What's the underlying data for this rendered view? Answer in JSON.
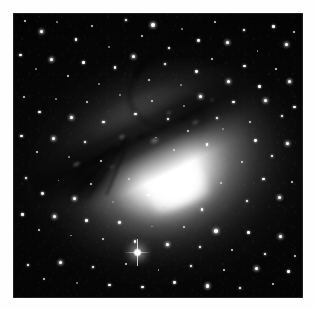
{
  "image": {
    "kind": "astronomical-photograph",
    "subject": "elliptical galaxy with dark dust lane",
    "orientation": "square plate, white mat border",
    "alt_text": "",
    "caption": "",
    "background_color": "#030303",
    "mat_color": "#fefefe",
    "glow_color": "#ffffff",
    "dust_color": "#050505"
  },
  "frame": {
    "x": 13,
    "y": 13,
    "width": 290,
    "height": 285
  },
  "galaxy": {
    "core_center_pct": [
      56,
      58
    ],
    "halo_rotation_deg": -21,
    "dust_lane_rotation_deg": -26,
    "dust_lane_direction": "lower-left to upper-right"
  },
  "stars": [
    {
      "x": 4.1,
      "y": 2.8,
      "r": 1.1,
      "cls": "dim"
    },
    {
      "x": 9.8,
      "y": 6.4,
      "r": 1.6,
      "cls": "big"
    },
    {
      "x": 15.2,
      "y": 3.1,
      "r": 0.9,
      "cls": "faint"
    },
    {
      "x": 21.7,
      "y": 9.2,
      "r": 1.3,
      "cls": ""
    },
    {
      "x": 27.4,
      "y": 4.6,
      "r": 1.0,
      "cls": "dim"
    },
    {
      "x": 33.1,
      "y": 11.8,
      "r": 0.9,
      "cls": "faint"
    },
    {
      "x": 38.9,
      "y": 2.4,
      "r": 1.2,
      "cls": ""
    },
    {
      "x": 44.6,
      "y": 7.9,
      "r": 1.0,
      "cls": "dim"
    },
    {
      "x": 48.2,
      "y": 4.1,
      "r": 1.9,
      "cls": "big"
    },
    {
      "x": 53.8,
      "y": 12.3,
      "r": 1.1,
      "cls": ""
    },
    {
      "x": 58.4,
      "y": 5.6,
      "r": 0.9,
      "cls": "faint"
    },
    {
      "x": 63.9,
      "y": 9.7,
      "r": 1.4,
      "cls": ""
    },
    {
      "x": 69.5,
      "y": 3.3,
      "r": 1.0,
      "cls": "dim"
    },
    {
      "x": 74.1,
      "y": 10.4,
      "r": 1.6,
      "cls": "big"
    },
    {
      "x": 79.6,
      "y": 6.1,
      "r": 1.1,
      "cls": ""
    },
    {
      "x": 84.3,
      "y": 13.2,
      "r": 0.9,
      "cls": "faint"
    },
    {
      "x": 89.8,
      "y": 4.8,
      "r": 1.3,
      "cls": ""
    },
    {
      "x": 94.2,
      "y": 10.9,
      "r": 1.5,
      "cls": "big"
    },
    {
      "x": 96.8,
      "y": 6.7,
      "r": 1.0,
      "cls": "dim"
    },
    {
      "x": 2.6,
      "y": 14.8,
      "r": 1.2,
      "cls": ""
    },
    {
      "x": 7.9,
      "y": 19.6,
      "r": 0.9,
      "cls": "faint"
    },
    {
      "x": 13.4,
      "y": 16.2,
      "r": 1.5,
      "cls": "big"
    },
    {
      "x": 18.8,
      "y": 22.1,
      "r": 1.0,
      "cls": "dim"
    },
    {
      "x": 24.3,
      "y": 17.4,
      "r": 1.2,
      "cls": ""
    },
    {
      "x": 29.7,
      "y": 24.8,
      "r": 0.9,
      "cls": "faint"
    },
    {
      "x": 35.2,
      "y": 19.1,
      "r": 1.1,
      "cls": ""
    },
    {
      "x": 41.6,
      "y": 15.3,
      "r": 1.7,
      "cls": "big"
    },
    {
      "x": 46.9,
      "y": 23.6,
      "r": 1.0,
      "cls": "dim"
    },
    {
      "x": 52.4,
      "y": 17.8,
      "r": 1.2,
      "cls": ""
    },
    {
      "x": 57.8,
      "y": 25.2,
      "r": 0.9,
      "cls": "faint"
    },
    {
      "x": 63.3,
      "y": 20.4,
      "r": 1.4,
      "cls": ""
    },
    {
      "x": 68.7,
      "y": 16.1,
      "r": 1.0,
      "cls": "dim"
    },
    {
      "x": 74.2,
      "y": 23.9,
      "r": 1.6,
      "cls": "big"
    },
    {
      "x": 79.8,
      "y": 18.6,
      "r": 1.1,
      "cls": ""
    },
    {
      "x": 85.1,
      "y": 25.7,
      "r": 1.3,
      "cls": ""
    },
    {
      "x": 90.6,
      "y": 19.8,
      "r": 1.0,
      "cls": "dim"
    },
    {
      "x": 95.4,
      "y": 24.2,
      "r": 1.5,
      "cls": "big"
    },
    {
      "x": 3.8,
      "y": 29.4,
      "r": 1.0,
      "cls": "dim"
    },
    {
      "x": 9.2,
      "y": 34.8,
      "r": 1.3,
      "cls": ""
    },
    {
      "x": 14.7,
      "y": 30.1,
      "r": 0.9,
      "cls": "faint"
    },
    {
      "x": 20.1,
      "y": 36.6,
      "r": 1.6,
      "cls": "big"
    },
    {
      "x": 25.6,
      "y": 31.3,
      "r": 1.0,
      "cls": "dim"
    },
    {
      "x": 31.2,
      "y": 38.2,
      "r": 1.1,
      "cls": ""
    },
    {
      "x": 36.8,
      "y": 28.7,
      "r": 0.9,
      "cls": "faint"
    },
    {
      "x": 42.3,
      "y": 35.4,
      "r": 1.2,
      "cls": ""
    },
    {
      "x": 47.9,
      "y": 30.8,
      "r": 1.0,
      "cls": "dim"
    },
    {
      "x": 53.4,
      "y": 37.1,
      "r": 1.1,
      "cls": ""
    },
    {
      "x": 59.1,
      "y": 32.6,
      "r": 0.9,
      "cls": "faint"
    },
    {
      "x": 64.8,
      "y": 29.3,
      "r": 1.5,
      "cls": "big"
    },
    {
      "x": 70.4,
      "y": 36.9,
      "r": 1.1,
      "cls": ""
    },
    {
      "x": 76.1,
      "y": 31.2,
      "r": 1.3,
      "cls": ""
    },
    {
      "x": 81.6,
      "y": 38.4,
      "r": 1.0,
      "cls": "dim"
    },
    {
      "x": 87.2,
      "y": 30.6,
      "r": 1.6,
      "cls": "big"
    },
    {
      "x": 92.8,
      "y": 36.1,
      "r": 1.1,
      "cls": ""
    },
    {
      "x": 97.1,
      "y": 32.9,
      "r": 1.2,
      "cls": ""
    },
    {
      "x": 2.9,
      "y": 43.2,
      "r": 1.2,
      "cls": ""
    },
    {
      "x": 8.4,
      "y": 48.7,
      "r": 1.0,
      "cls": "dim"
    },
    {
      "x": 13.9,
      "y": 44.1,
      "r": 1.5,
      "cls": "big"
    },
    {
      "x": 19.3,
      "y": 50.6,
      "r": 0.9,
      "cls": "faint"
    },
    {
      "x": 24.8,
      "y": 45.3,
      "r": 1.1,
      "cls": ""
    },
    {
      "x": 30.4,
      "y": 52.1,
      "r": 1.0,
      "cls": "dim"
    },
    {
      "x": 83.7,
      "y": 44.8,
      "r": 1.4,
      "cls": ""
    },
    {
      "x": 89.2,
      "y": 50.3,
      "r": 1.1,
      "cls": ""
    },
    {
      "x": 94.6,
      "y": 45.7,
      "r": 1.6,
      "cls": "big"
    },
    {
      "x": 79.1,
      "y": 52.4,
      "r": 1.0,
      "cls": "dim"
    },
    {
      "x": 4.6,
      "y": 57.9,
      "r": 1.1,
      "cls": ""
    },
    {
      "x": 10.2,
      "y": 63.4,
      "r": 1.4,
      "cls": ""
    },
    {
      "x": 15.7,
      "y": 58.8,
      "r": 0.9,
      "cls": "faint"
    },
    {
      "x": 21.3,
      "y": 65.2,
      "r": 1.6,
      "cls": "big"
    },
    {
      "x": 26.8,
      "y": 60.1,
      "r": 1.0,
      "cls": "dim"
    },
    {
      "x": 86.4,
      "y": 58.3,
      "r": 1.2,
      "cls": ""
    },
    {
      "x": 91.8,
      "y": 64.7,
      "r": 1.5,
      "cls": "big"
    },
    {
      "x": 96.3,
      "y": 59.2,
      "r": 1.0,
      "cls": "dim"
    },
    {
      "x": 80.6,
      "y": 66.1,
      "r": 1.1,
      "cls": ""
    },
    {
      "x": 3.2,
      "y": 70.6,
      "r": 1.3,
      "cls": ""
    },
    {
      "x": 8.8,
      "y": 76.2,
      "r": 1.0,
      "cls": "dim"
    },
    {
      "x": 14.3,
      "y": 71.4,
      "r": 1.7,
      "cls": "big"
    },
    {
      "x": 19.9,
      "y": 78.1,
      "r": 0.9,
      "cls": "faint"
    },
    {
      "x": 25.4,
      "y": 72.8,
      "r": 1.2,
      "cls": ""
    },
    {
      "x": 31.1,
      "y": 79.3,
      "r": 1.0,
      "cls": "dim"
    },
    {
      "x": 36.7,
      "y": 73.6,
      "r": 1.4,
      "cls": ""
    },
    {
      "x": 42.2,
      "y": 80.2,
      "r": 1.1,
      "cls": ""
    },
    {
      "x": 47.8,
      "y": 74.9,
      "r": 0.9,
      "cls": "faint"
    },
    {
      "x": 53.3,
      "y": 81.4,
      "r": 1.5,
      "cls": "big"
    },
    {
      "x": 58.9,
      "y": 75.2,
      "r": 1.0,
      "cls": "dim"
    },
    {
      "x": 64.4,
      "y": 82.1,
      "r": 1.2,
      "cls": ""
    },
    {
      "x": 70.1,
      "y": 76.4,
      "r": 1.8,
      "cls": "big"
    },
    {
      "x": 75.6,
      "y": 83.2,
      "r": 1.0,
      "cls": "dim"
    },
    {
      "x": 81.2,
      "y": 77.1,
      "r": 1.3,
      "cls": ""
    },
    {
      "x": 86.8,
      "y": 84.6,
      "r": 1.1,
      "cls": ""
    },
    {
      "x": 92.3,
      "y": 78.3,
      "r": 1.6,
      "cls": "big"
    },
    {
      "x": 97.2,
      "y": 85.1,
      "r": 1.0,
      "cls": "dim"
    },
    {
      "x": 5.1,
      "y": 88.4,
      "r": 1.2,
      "cls": ""
    },
    {
      "x": 10.8,
      "y": 93.2,
      "r": 1.0,
      "cls": "dim"
    },
    {
      "x": 16.4,
      "y": 87.6,
      "r": 1.5,
      "cls": "big"
    },
    {
      "x": 22.1,
      "y": 94.8,
      "r": 0.9,
      "cls": "faint"
    },
    {
      "x": 27.7,
      "y": 89.1,
      "r": 1.1,
      "cls": ""
    },
    {
      "x": 33.3,
      "y": 95.4,
      "r": 1.3,
      "cls": ""
    },
    {
      "x": 38.9,
      "y": 88.2,
      "r": 1.0,
      "cls": "dim"
    },
    {
      "x": 44.6,
      "y": 96.1,
      "r": 1.2,
      "cls": ""
    },
    {
      "x": 50.2,
      "y": 90.3,
      "r": 0.9,
      "cls": "faint"
    },
    {
      "x": 55.8,
      "y": 94.6,
      "r": 1.4,
      "cls": ""
    },
    {
      "x": 61.4,
      "y": 88.9,
      "r": 1.1,
      "cls": ""
    },
    {
      "x": 67.1,
      "y": 95.8,
      "r": 1.6,
      "cls": "big"
    },
    {
      "x": 72.7,
      "y": 90.1,
      "r": 1.0,
      "cls": "dim"
    },
    {
      "x": 78.3,
      "y": 96.4,
      "r": 1.2,
      "cls": ""
    },
    {
      "x": 83.9,
      "y": 89.6,
      "r": 1.5,
      "cls": "big"
    },
    {
      "x": 89.6,
      "y": 95.2,
      "r": 1.0,
      "cls": "dim"
    },
    {
      "x": 95.1,
      "y": 90.8,
      "r": 1.3,
      "cls": ""
    },
    {
      "x": 60.2,
      "y": 41.3,
      "r": 1.0,
      "cls": "dim"
    },
    {
      "x": 66.8,
      "y": 46.2,
      "r": 1.2,
      "cls": ""
    },
    {
      "x": 72.4,
      "y": 40.8,
      "r": 0.9,
      "cls": "faint"
    },
    {
      "x": 55.6,
      "y": 48.1,
      "r": 1.0,
      "cls": "dim"
    },
    {
      "x": 49.3,
      "y": 43.7,
      "r": 0.9,
      "cls": "faint"
    },
    {
      "x": 40.1,
      "y": 58.4,
      "r": 1.0,
      "cls": "dim"
    },
    {
      "x": 46.7,
      "y": 63.9,
      "r": 1.1,
      "cls": ""
    },
    {
      "x": 34.6,
      "y": 66.2,
      "r": 0.9,
      "cls": "faint"
    },
    {
      "x": 52.1,
      "y": 68.3,
      "r": 1.0,
      "cls": "dim"
    },
    {
      "x": 58.7,
      "y": 62.1,
      "r": 1.1,
      "cls": ""
    },
    {
      "x": 65.2,
      "y": 68.9,
      "r": 1.2,
      "cls": ""
    },
    {
      "x": 71.8,
      "y": 59.6,
      "r": 1.0,
      "cls": "dim"
    }
  ],
  "bright_star": {
    "x_pct": 43.0,
    "y_pct": 84.0,
    "label": "foreground-star"
  }
}
